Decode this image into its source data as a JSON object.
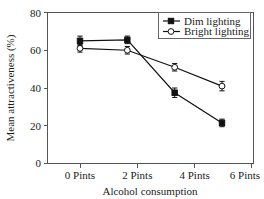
{
  "chart_data": {
    "type": "line",
    "title": "",
    "xlabel": "Alcohol consumption",
    "ylabel": "Mean attractiveness (%)",
    "categories": [
      "0 Pints",
      "2 Pints",
      "4 Pints",
      "6 Pints"
    ],
    "ylim": [
      0,
      80
    ],
    "yticks": [
      0,
      20,
      40,
      60,
      80
    ],
    "ytick_labels": [
      "0",
      "20",
      "40",
      "60",
      "80"
    ],
    "grid": false,
    "legend_position": "top-right",
    "error_bars": true,
    "series": [
      {
        "name": "Dim lighting",
        "marker": "filled-square",
        "color": "#111111",
        "values": [
          65,
          65.5,
          37.5,
          21.5
        ],
        "errors": [
          2.5,
          2.0,
          2.5,
          2.0
        ]
      },
      {
        "name": "Bright lighting",
        "marker": "open-circle",
        "color": "#111111",
        "values": [
          61,
          60,
          51,
          41
        ],
        "errors": [
          2.0,
          2.0,
          2.0,
          2.5
        ]
      }
    ]
  },
  "axes": {
    "y_label": "Mean attractiveness (%)",
    "x_label": "Alcohol consumption",
    "y_tick_0": "0",
    "y_tick_1": "20",
    "y_tick_2": "40",
    "y_tick_3": "60",
    "y_tick_4": "80",
    "x_tick_0": "0 Pints",
    "x_tick_1": "2 Pints",
    "x_tick_2": "4 Pints",
    "x_tick_3": "6 Pints"
  },
  "legend": {
    "entry_0": "Dim lighting",
    "entry_1": "Bright lighting"
  }
}
